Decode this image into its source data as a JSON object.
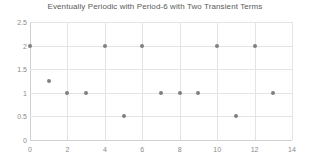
{
  "chart_data": {
    "type": "scatter",
    "title": "Eventually Periodic with Period-6 with Two Transient Terms",
    "xlabel": "",
    "ylabel": "",
    "xlim": [
      0,
      14
    ],
    "ylim": [
      0,
      2.5
    ],
    "grid": true,
    "legend": null,
    "series_color": "#808080",
    "xticks": [
      "0",
      "2",
      "4",
      "6",
      "8",
      "10",
      "12",
      "14"
    ],
    "xtick_values": [
      0,
      2,
      4,
      6,
      8,
      10,
      12,
      14
    ],
    "yticks": [
      "0",
      "0.5",
      "1",
      "1.5",
      "2",
      "2.5"
    ],
    "ytick_values": [
      0,
      0.5,
      1,
      1.5,
      2,
      2.5
    ],
    "x": [
      0,
      1,
      2,
      3,
      4,
      5,
      6,
      7,
      8,
      9,
      10,
      11,
      12,
      13
    ],
    "y": [
      2,
      1.25,
      1,
      1,
      2,
      0.5,
      2,
      1,
      1,
      1,
      2,
      0.5,
      2,
      1
    ],
    "points": [
      {
        "x": 0,
        "y": 2
      },
      {
        "x": 1,
        "y": 1.25
      },
      {
        "x": 2,
        "y": 1
      },
      {
        "x": 3,
        "y": 1
      },
      {
        "x": 4,
        "y": 2
      },
      {
        "x": 5,
        "y": 0.5
      },
      {
        "x": 6,
        "y": 2
      },
      {
        "x": 7,
        "y": 1
      },
      {
        "x": 8,
        "y": 1
      },
      {
        "x": 9,
        "y": 1
      },
      {
        "x": 10,
        "y": 2
      },
      {
        "x": 11,
        "y": 0.5
      },
      {
        "x": 12,
        "y": 2
      },
      {
        "x": 13,
        "y": 1
      }
    ]
  }
}
